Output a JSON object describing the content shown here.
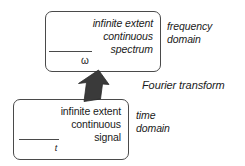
{
  "diagram": {
    "background_color": "#ffffff",
    "box_border_color": "#4a4a4a",
    "arrow_color": "#3a3a3a"
  },
  "frequency_box": {
    "lines": [
      "infinite extent",
      "continuous",
      "spectrum"
    ],
    "axis_variable": "ω"
  },
  "time_box": {
    "lines": [
      "infinite extent",
      "continuous",
      "signal"
    ],
    "axis_variable": "t"
  },
  "labels": {
    "frequency_domain": [
      "frequency",
      "domain"
    ],
    "time_domain": [
      "time",
      "domain"
    ],
    "transform": "Fourier transform"
  }
}
